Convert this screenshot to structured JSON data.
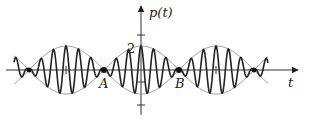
{
  "diagram": {
    "y_axis_label": "p(t)",
    "x_axis_label": "t",
    "amplitude_label": "2",
    "points": [
      {
        "label": "A"
      },
      {
        "label": "B"
      }
    ],
    "colors": {
      "signal": "#222222",
      "envelope": "#888888",
      "axis": "#333333"
    }
  }
}
